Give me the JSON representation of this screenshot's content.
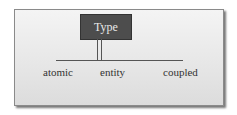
{
  "diagram": {
    "root": {
      "label": "Type"
    },
    "children": [
      {
        "label": "atomic"
      },
      {
        "label": "entity"
      },
      {
        "label": "coupled"
      }
    ],
    "colors": {
      "root_fill": "#4d4d4d",
      "root_text": "#e8e8e8",
      "line": "#555555"
    }
  }
}
